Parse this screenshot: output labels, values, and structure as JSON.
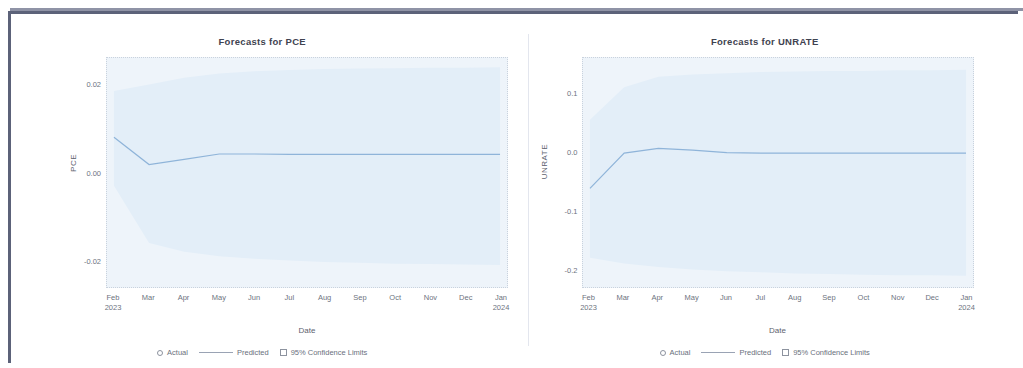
{
  "document": {
    "frame_color": "#5c6279",
    "background": "#ffffff"
  },
  "panels": [
    {
      "id": "pce",
      "title": "Forecasts for PCE",
      "y_axis_title": "PCE",
      "x_axis_title": "Date",
      "y_ticks": [
        "0.02",
        "0.00",
        "-0.02"
      ],
      "x_ticks": [
        {
          "label": "Feb",
          "sub": "2023"
        },
        {
          "label": "Mar",
          "sub": ""
        },
        {
          "label": "Apr",
          "sub": ""
        },
        {
          "label": "May",
          "sub": ""
        },
        {
          "label": "Jun",
          "sub": ""
        },
        {
          "label": "Jul",
          "sub": ""
        },
        {
          "label": "Aug",
          "sub": ""
        },
        {
          "label": "Sep",
          "sub": ""
        },
        {
          "label": "Oct",
          "sub": ""
        },
        {
          "label": "Nov",
          "sub": ""
        },
        {
          "label": "Dec",
          "sub": ""
        },
        {
          "label": "Jan",
          "sub": "2024"
        }
      ],
      "legend": [
        {
          "marker": "circle",
          "label": "Actual"
        },
        {
          "marker": "line",
          "label": "Predicted"
        },
        {
          "marker": "square",
          "label": "95% Confidence Limits"
        }
      ]
    },
    {
      "id": "unrate",
      "title": "Forecasts for UNRATE",
      "y_axis_title": "UNRATE",
      "x_axis_title": "Date",
      "y_ticks": [
        "0.1",
        "0.0",
        "-0.1",
        "-0.2"
      ],
      "x_ticks": [
        {
          "label": "Feb",
          "sub": "2023"
        },
        {
          "label": "Mar",
          "sub": ""
        },
        {
          "label": "Apr",
          "sub": ""
        },
        {
          "label": "May",
          "sub": ""
        },
        {
          "label": "Jun",
          "sub": ""
        },
        {
          "label": "Jul",
          "sub": ""
        },
        {
          "label": "Aug",
          "sub": ""
        },
        {
          "label": "Sep",
          "sub": ""
        },
        {
          "label": "Oct",
          "sub": ""
        },
        {
          "label": "Nov",
          "sub": ""
        },
        {
          "label": "Dec",
          "sub": ""
        },
        {
          "label": "Jan",
          "sub": "2024"
        }
      ],
      "legend": [
        {
          "marker": "circle",
          "label": "Actual"
        },
        {
          "marker": "line",
          "label": "Predicted"
        },
        {
          "marker": "square",
          "label": "95% Confidence Limits"
        }
      ]
    }
  ],
  "chart_data": [
    {
      "type": "line",
      "id": "pce",
      "title": "Forecasts for PCE",
      "xlabel": "Date",
      "ylabel": "PCE",
      "ylim": [
        -0.026,
        0.026
      ],
      "ytick_values": [
        0.02,
        0.0,
        -0.02
      ],
      "x": [
        "Feb 2023",
        "Mar 2023",
        "Apr 2023",
        "May 2023",
        "Jun 2023",
        "Jul 2023",
        "Aug 2023",
        "Sep 2023",
        "Oct 2023",
        "Nov 2023",
        "Dec 2023",
        "Jan 2024"
      ],
      "grid": false,
      "legend_position": "bottom",
      "series": [
        {
          "name": "Predicted",
          "style": "line",
          "color": "#8fb4d9",
          "values": [
            0.008,
            0.0018,
            0.003,
            0.0042,
            0.0042,
            0.0041,
            0.0041,
            0.0041,
            0.0041,
            0.0041,
            0.0041,
            0.0041
          ]
        },
        {
          "name": "95% Confidence Limits Upper",
          "style": "band",
          "color": "#e3eef8",
          "values": [
            0.0185,
            0.02,
            0.0215,
            0.0225,
            0.023,
            0.0233,
            0.0235,
            0.0236,
            0.0237,
            0.0238,
            0.0238,
            0.0239
          ]
        },
        {
          "name": "95% Confidence Limits Lower",
          "style": "band",
          "color": "#e3eef8",
          "values": [
            -0.003,
            -0.016,
            -0.018,
            -0.019,
            -0.0196,
            -0.02,
            -0.0203,
            -0.0205,
            -0.0207,
            -0.0208,
            -0.0209,
            -0.021
          ]
        },
        {
          "name": "Actual",
          "style": "marker",
          "color": "#8fb4d9",
          "values": []
        }
      ]
    },
    {
      "type": "line",
      "id": "unrate",
      "title": "Forecasts for UNRATE",
      "xlabel": "Date",
      "ylabel": "UNRATE",
      "ylim": [
        -0.23,
        0.16
      ],
      "ytick_values": [
        0.1,
        0.0,
        -0.1,
        -0.2
      ],
      "x": [
        "Feb 2023",
        "Mar 2023",
        "Apr 2023",
        "May 2023",
        "Jun 2023",
        "Jul 2023",
        "Aug 2023",
        "Sep 2023",
        "Oct 2023",
        "Nov 2023",
        "Dec 2023",
        "Jan 2024"
      ],
      "grid": false,
      "legend_position": "bottom",
      "series": [
        {
          "name": "Predicted",
          "style": "line",
          "color": "#8fb4d9",
          "values": [
            -0.062,
            -0.002,
            0.006,
            0.003,
            -0.001,
            -0.002,
            -0.002,
            -0.002,
            -0.002,
            -0.002,
            -0.002,
            -0.002
          ]
        },
        {
          "name": "95% Confidence Limits Upper",
          "style": "band",
          "color": "#e3eef8",
          "values": [
            0.055,
            0.11,
            0.128,
            0.132,
            0.134,
            0.136,
            0.137,
            0.138,
            0.138,
            0.139,
            0.139,
            0.14
          ]
        },
        {
          "name": "95% Confidence Limits Lower",
          "style": "band",
          "color": "#e3eef8",
          "values": [
            -0.18,
            -0.19,
            -0.196,
            -0.2,
            -0.203,
            -0.205,
            -0.207,
            -0.208,
            -0.209,
            -0.21,
            -0.21,
            -0.211
          ]
        },
        {
          "name": "Actual",
          "style": "marker",
          "color": "#8fb4d9",
          "values": []
        }
      ]
    }
  ]
}
